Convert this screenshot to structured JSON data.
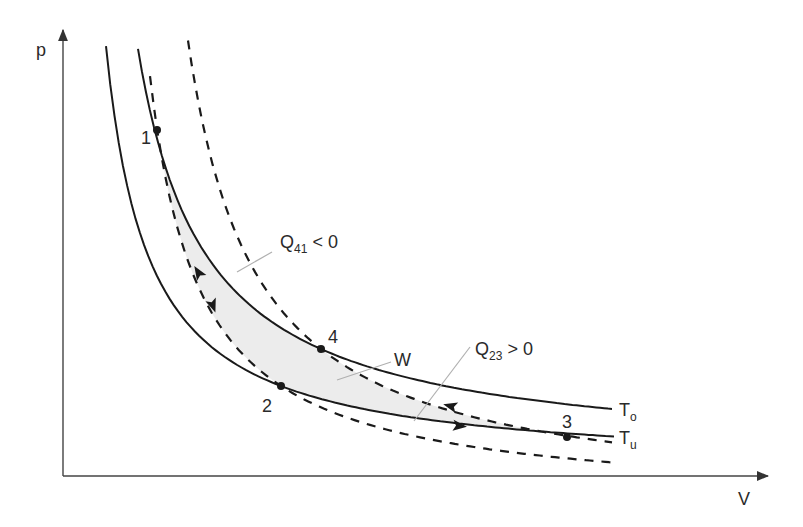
{
  "diagram": {
    "axes": {
      "y_label": "p",
      "x_label": "V",
      "origin": [
        63,
        476
      ],
      "y_tip": [
        63,
        30
      ],
      "x_tip": [
        768,
        476
      ]
    },
    "curves": [
      {
        "id": "isotherm-Tu",
        "style": "solid",
        "a": 469.5,
        "B": 18200,
        "c": 63,
        "x_from": 106,
        "x_to": 614
      },
      {
        "id": "isotherm-To",
        "style": "solid",
        "a": 460.6,
        "B": 28000,
        "c": 70,
        "x_from": 138,
        "x_to": 612
      },
      {
        "id": "adiabat-inner",
        "style": "dashed",
        "a": 504.2,
        "B": 21400,
        "c": 100,
        "x_from": 150,
        "x_to": 613
      },
      {
        "id": "adiabat-outer",
        "style": "dashed",
        "a": 506.7,
        "B": 31700,
        "c": 120,
        "x_from": 188,
        "x_to": 612
      }
    ],
    "curve_labels": [
      {
        "text": "T",
        "sub": "o",
        "x": 619,
        "y": 416
      },
      {
        "text": "T",
        "sub": "u",
        "x": 619,
        "y": 444
      }
    ],
    "points": [
      {
        "label": "1",
        "x": 157,
        "y": 130,
        "lx": 141,
        "ly": 144
      },
      {
        "label": "2",
        "x": 281,
        "y": 386,
        "lx": 262,
        "ly": 412
      },
      {
        "label": "3",
        "x": 567,
        "y": 437,
        "lx": 562,
        "ly": 428
      },
      {
        "label": "4",
        "x": 321,
        "y": 349,
        "lx": 328,
        "ly": 343
      }
    ],
    "annotations": [
      {
        "text": "Q",
        "sub": "41",
        "rest": " < 0",
        "x": 280,
        "y": 248,
        "line": [
          272,
          252,
          237,
          272
        ]
      },
      {
        "text": "W",
        "sub": "",
        "rest": "",
        "x": 394,
        "y": 366,
        "line": [
          391,
          362,
          337,
          380
        ]
      },
      {
        "text": "Q",
        "sub": "23",
        "rest": " > 0",
        "x": 475,
        "y": 355,
        "line": [
          470,
          347,
          414,
          421
        ]
      }
    ],
    "arrows": [
      {
        "x": 198,
        "y": 272,
        "angle": -122
      },
      {
        "x": 213,
        "y": 306,
        "angle": 70
      },
      {
        "x": 450,
        "y": 406,
        "angle": 195
      },
      {
        "x": 460,
        "y": 426,
        "angle": 6
      }
    ],
    "colors": {
      "ink": "#1a1a1a",
      "axis": "#444444",
      "shade": "#ececec",
      "leader": "#b0b0b0"
    }
  }
}
